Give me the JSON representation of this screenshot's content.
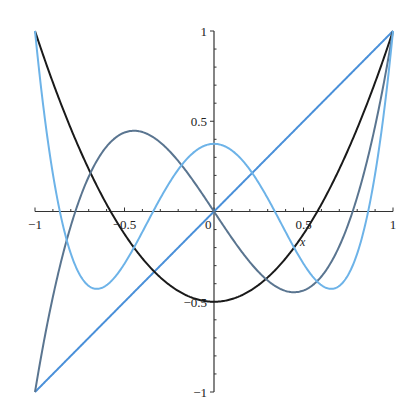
{
  "chart_data": {
    "type": "line",
    "title": "",
    "xlabel": "x",
    "ylabel": "",
    "xlim": [
      -1,
      1
    ],
    "ylim": [
      -1,
      1
    ],
    "grid": false,
    "legend": "none",
    "x_ticks": [
      {
        "value": -1,
        "label": "-1"
      },
      {
        "value": -0.5,
        "label": "-0.5"
      },
      {
        "value": 0,
        "label": "0"
      },
      {
        "value": 0.5,
        "label": "0.5"
      },
      {
        "value": 1,
        "label": "1"
      }
    ],
    "y_ticks": [
      {
        "value": 1,
        "label": "1"
      },
      {
        "value": 0.5,
        "label": "0.5"
      },
      {
        "value": -0.5,
        "label": "-0.5"
      },
      {
        "value": -1,
        "label": "-1"
      }
    ],
    "series": [
      {
        "name": "P1(x) = x",
        "color": "#4a90d9",
        "coeffs": [
          0,
          1
        ],
        "x": [
          -1,
          -0.5,
          0,
          0.5,
          1
        ],
        "values": [
          -1,
          -0.5,
          0,
          0.5,
          1
        ]
      },
      {
        "name": "P2(x) = (3x^2-1)/2",
        "color": "#1a1a1a",
        "coeffs": [
          -0.5,
          0,
          1.5
        ],
        "x": [
          -1,
          -0.5,
          0,
          0.5,
          1
        ],
        "values": [
          1,
          -0.125,
          -0.5,
          -0.125,
          1
        ]
      },
      {
        "name": "P3(x) = (5x^3-3x)/2",
        "color": "#5a7590",
        "coeffs": [
          0,
          -1.5,
          0,
          2.5
        ],
        "x": [
          -1,
          -0.447,
          0,
          0.447,
          1
        ],
        "values": [
          -1,
          0.447,
          0,
          -0.447,
          1
        ]
      },
      {
        "name": "P4(x) = (35x^4-30x^2+3)/8",
        "color": "#6db3e8",
        "coeffs": [
          0.375,
          0,
          -3.75,
          0,
          4.375
        ],
        "x": [
          -1,
          -0.655,
          0,
          0.655,
          1
        ],
        "values": [
          1,
          -0.429,
          0.375,
          -0.429,
          1
        ]
      }
    ]
  },
  "axis": {
    "x_title": "x"
  }
}
